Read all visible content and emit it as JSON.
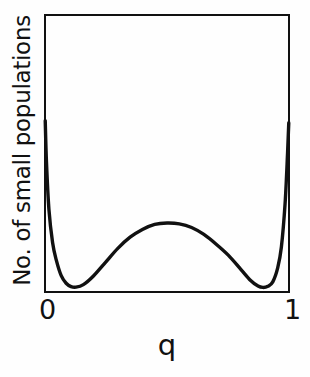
{
  "figure": {
    "background_color": "#fefefe",
    "ink_color": "#111111"
  },
  "axes": {
    "y_label": "No. of small populations",
    "x_label": "q",
    "x_ticks": [
      "0",
      "1"
    ],
    "y_ticks": []
  },
  "chart_data": {
    "type": "line",
    "title": "",
    "subtitle": "",
    "xlabel": "q",
    "ylabel": "No. of small populations",
    "xlim": [
      0,
      1
    ],
    "ylim": [
      0,
      1
    ],
    "x_tick_labels": [
      "0",
      "1"
    ],
    "x_tick_values": [
      0,
      1
    ],
    "y_tick_labels": [],
    "grid": false,
    "legend": false,
    "legend_position": "none",
    "annotations": [],
    "series": [
      {
        "name": "distribution of small populations",
        "description": "U-shaped bimodal distribution: very high at q=0 and q=1, low minima near q=0.13 and q=0.88, broad intermediate hump peaking near q=0.5",
        "x": [
          0.005,
          0.01,
          0.02,
          0.035,
          0.05,
          0.07,
          0.09,
          0.11,
          0.13,
          0.16,
          0.2,
          0.25,
          0.3,
          0.35,
          0.4,
          0.45,
          0.5,
          0.55,
          0.6,
          0.65,
          0.7,
          0.75,
          0.8,
          0.84,
          0.87,
          0.89,
          0.91,
          0.93,
          0.95,
          0.965,
          0.98,
          0.99,
          0.995
        ],
        "y": [
          0.618,
          0.47,
          0.3,
          0.18,
          0.118,
          0.062,
          0.035,
          0.023,
          0.021,
          0.03,
          0.06,
          0.11,
          0.16,
          0.2,
          0.228,
          0.246,
          0.251,
          0.248,
          0.235,
          0.21,
          0.175,
          0.135,
          0.085,
          0.045,
          0.025,
          0.02,
          0.024,
          0.04,
          0.09,
          0.165,
          0.32,
          0.5,
          0.61
        ]
      }
    ]
  },
  "curve_path": "M 2.6,106 C 3.4,150 5.0,196 8.5,228 C 13.0,268 20.0,276.5 33.5,276.5 C 47.0,276.5 58.0,258 70.0,236 C 86.0,206 104.0,182 123.5,179.5 C 143.0,177 160.0,190 176.0,212 C 190.0,231 202.0,252 213.0,266 C 222.5,278 230.0,279.5 237.5,275.5 C 242.5,272.5 244.5,256 245.3,214 C 245.9,180 246.0,140 246.0,108",
  "curve_width": 3.4
}
